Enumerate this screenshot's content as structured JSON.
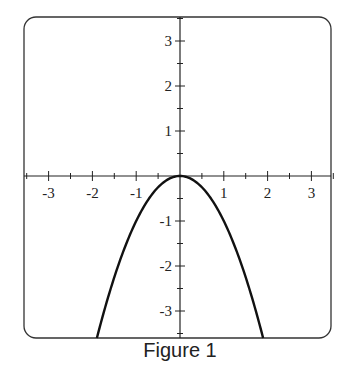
{
  "caption": "Figure 1",
  "chart_data": {
    "type": "line",
    "title": "",
    "caption": "Figure 1",
    "xlabel": "",
    "ylabel": "",
    "function": "y = -x^2",
    "xlim": [
      -3.5,
      3.5
    ],
    "ylim": [
      -3.6,
      3.5
    ],
    "x_ticks": [
      -3,
      -2,
      -1,
      1,
      2,
      3
    ],
    "y_ticks": [
      3,
      2,
      1,
      -1,
      -2,
      -3
    ],
    "minor_tick_step": 0.5,
    "grid": false,
    "legend": null,
    "series": [
      {
        "name": "y = -x^2",
        "x": [
          -1.9,
          -1.5,
          -1,
          -0.5,
          0,
          0.5,
          1,
          1.5,
          1.9
        ],
        "y": [
          -3.61,
          -2.25,
          -1,
          -0.25,
          0,
          -0.25,
          -1,
          -2.25,
          -3.61
        ]
      }
    ]
  },
  "colors": {
    "axis": "#222222",
    "curve": "#111111",
    "frame": "#333333"
  }
}
